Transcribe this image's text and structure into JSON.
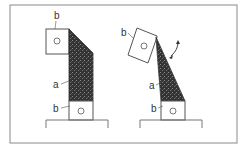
{
  "diagram": {
    "left_figure": {
      "labels": {
        "top_block": "b",
        "middle_block": "a",
        "bottom_block": "b"
      }
    },
    "right_figure": {
      "labels": {
        "top_block": "b",
        "middle_block": "a",
        "bottom_block": "b"
      },
      "rotation_arrow": "curved-double-arrow"
    },
    "colors": {
      "frame": "#8a8a8a",
      "line": "#444444",
      "fill": "#2a2a2a"
    }
  }
}
